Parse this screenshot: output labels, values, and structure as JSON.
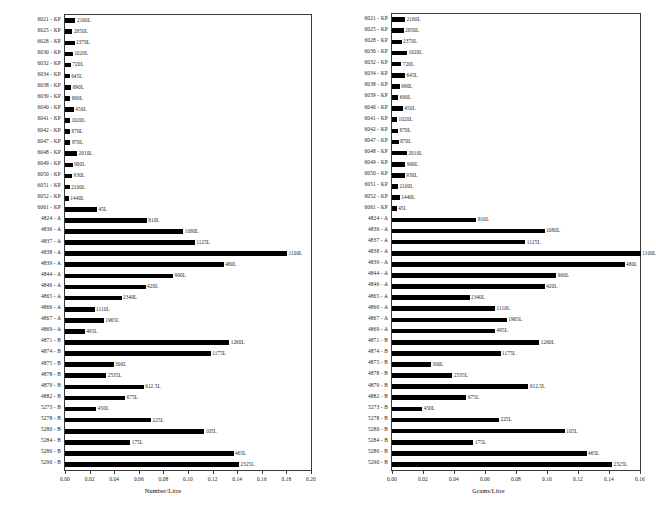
{
  "chart_data": [
    {
      "id": "left",
      "type": "bar",
      "orientation": "horizontal",
      "title": "",
      "xlabel": "Number/Litre",
      "ylabel": "",
      "xlim": [
        0.0,
        0.2
      ],
      "xticks": [
        "0.00",
        "0.02",
        "0.04",
        "0.06",
        "0.08",
        "0.10",
        "0.12",
        "0.14",
        "0.16",
        "0.18",
        "0.20"
      ],
      "xtick_values": [
        0.0,
        0.02,
        0.04,
        0.06,
        0.08,
        0.1,
        0.12,
        0.14,
        0.16,
        0.18,
        0.2
      ],
      "grid": false,
      "legend": "none",
      "categories": [
        "6021 - KP",
        "6025 - KP",
        "6028 - KP",
        "6030 - KP",
        "6032 - KP",
        "6034 - KP",
        "6038 - KP",
        "6039 - KP",
        "6040 - KP",
        "6041 - KP",
        "6042 - KP",
        "6047 - KP",
        "6048 - KP",
        "6049 - KP",
        "6050 - KP",
        "6051 - KP",
        "6052 - KP",
        "6061 - KP",
        "4824 - A",
        "4836 - A",
        "4837 - A",
        "4838 - A",
        "4839 - A",
        "4844 - A",
        "4846 - A",
        "4865 - A",
        "4866 - A",
        "4867 - A",
        "4869 - A",
        "4871 - B",
        "4874 - B",
        "4875 - B",
        "4878 - B",
        "4879 - B",
        "4882 - B",
        "5273 - B",
        "5278 - B",
        "5280 - B",
        "5284 - B",
        "5286 - B",
        "5290 - B"
      ],
      "values": [
        0.0085,
        0.006,
        0.0078,
        0.0062,
        0.0048,
        0.0038,
        0.005,
        0.0042,
        0.0072,
        0.004,
        0.0041,
        0.0044,
        0.0098,
        0.0062,
        0.0057,
        0.0038,
        0.0031,
        0.026,
        0.0665,
        0.0962,
        0.1055,
        0.1805,
        0.129,
        0.088,
        0.0655,
        0.046,
        0.024,
        0.0315,
        0.016,
        0.1335,
        0.1185,
        0.0395,
        0.0335,
        0.064,
        0.049,
        0.0255,
        0.07,
        0.113,
        0.053,
        0.137,
        0.1415
      ],
      "bar_labels": [
        "2160L",
        "2850L",
        "2370L",
        "1020L",
        "720L",
        "645L",
        "690L",
        "690L",
        "450L",
        "1020L",
        "870L",
        "870L",
        "2010L",
        "900L",
        "930L",
        "2100L",
        "1440L",
        "45L",
        "810L",
        "1080L",
        "1125L",
        "1100L",
        "480L",
        "900L",
        "420L",
        "2340L",
        "1110L",
        "1965L",
        "495L",
        "1260L",
        "1175L",
        "300L",
        "2535L",
        "612.5L",
        "675L",
        "450L",
        "225L",
        "105L",
        "175L",
        "465L",
        "2325L"
      ]
    },
    {
      "id": "right",
      "type": "bar",
      "orientation": "horizontal",
      "title": "",
      "xlabel": "Grams/Litre",
      "ylabel": "",
      "xlim": [
        0.0,
        0.16
      ],
      "xticks": [
        "0.00",
        "0.02",
        "0.04",
        "0.06",
        "0.08",
        "0.10",
        "0.12",
        "0.14",
        "0.16"
      ],
      "xtick_values": [
        0.0,
        0.02,
        0.04,
        0.06,
        0.08,
        0.1,
        0.12,
        0.14,
        0.16
      ],
      "grid": false,
      "legend": "none",
      "categories": [
        "6021 - KP",
        "6025 - KP",
        "6028 - KP",
        "6030 - KP",
        "6032 - KP",
        "6034 - KP",
        "6038 - KP",
        "6039 - KP",
        "6040 - KP",
        "6041 - KP",
        "6042 - KP",
        "6047 - KP",
        "6048 - KP",
        "6049 - KP",
        "6050 - KP",
        "6051 - KP",
        "6052 - KP",
        "6061 - KP",
        "4824 - A",
        "4836 - A",
        "4837 - A",
        "4838 - A",
        "4839 - A",
        "4844 - A",
        "4846 - A",
        "4865 - A",
        "4866 - A",
        "4867 - A",
        "4869 - A",
        "4871 - B",
        "4874 - B",
        "4875 - B",
        "4878 - B",
        "4879 - B",
        "4882 - B",
        "5273 - B",
        "5278 - B",
        "5280 - B",
        "5284 - B",
        "5286 - B",
        "5290 - B"
      ],
      "values": [
        0.0085,
        0.0076,
        0.0062,
        0.0096,
        0.0061,
        0.0084,
        0.005,
        0.0041,
        0.007,
        0.0033,
        0.004,
        0.0043,
        0.0096,
        0.0087,
        0.0083,
        0.0038,
        0.005,
        0.003,
        0.0545,
        0.0985,
        0.086,
        0.1605,
        0.15,
        0.106,
        0.0985,
        0.05,
        0.0665,
        0.074,
        0.0665,
        0.095,
        0.07,
        0.025,
        0.039,
        0.088,
        0.048,
        0.0195,
        0.069,
        0.1115,
        0.0525,
        0.1255,
        0.142
      ],
      "bar_labels": [
        "2160L",
        "2850L",
        "2370L",
        "1020L",
        "720L",
        "645L",
        "690L",
        "690L",
        "450L",
        "1020L",
        "870L",
        "870L",
        "2010L",
        "900L",
        "930L",
        "2100L",
        "1440L",
        "45L",
        "810L",
        "1080L",
        "1125L",
        "1100L",
        "480L",
        "900L",
        "420L",
        "2340L",
        "1110L",
        "1965L",
        "495L",
        "1260L",
        "1175L",
        "300L",
        "2535L",
        "612.5L",
        "675L",
        "450L",
        "225L",
        "105L",
        "175L",
        "465L",
        "2325L"
      ]
    }
  ],
  "style": {
    "bar_color": "#000000",
    "border_color": "#3a3a3a",
    "text_color": "#1a1a1a",
    "background": "#ffffff"
  }
}
